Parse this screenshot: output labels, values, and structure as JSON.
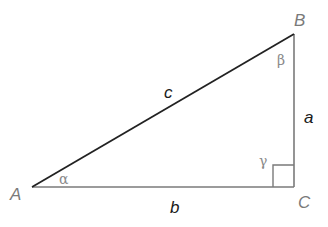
{
  "diagram": {
    "type": "right-triangle",
    "vertices": {
      "A": {
        "label": "A",
        "x": 32,
        "y": 187
      },
      "B": {
        "label": "B",
        "x": 294,
        "y": 34
      },
      "C": {
        "label": "C",
        "x": 294,
        "y": 187
      }
    },
    "sides": {
      "a": {
        "label": "a",
        "from": "B",
        "to": "C"
      },
      "b": {
        "label": "b",
        "from": "A",
        "to": "C"
      },
      "c": {
        "label": "c",
        "from": "A",
        "to": "B"
      }
    },
    "angles": {
      "alpha": {
        "label": "α",
        "at": "A"
      },
      "beta": {
        "label": "β",
        "at": "B"
      },
      "gamma": {
        "label": "γ",
        "at": "C",
        "right_angle": true
      }
    },
    "colors": {
      "hypotenuse": "#222222",
      "legs": "#7a7a7a",
      "side_labels": "#1a1a1a",
      "vertex_labels": "#7a7a7a",
      "angle_labels": "#8a8a8a"
    }
  }
}
